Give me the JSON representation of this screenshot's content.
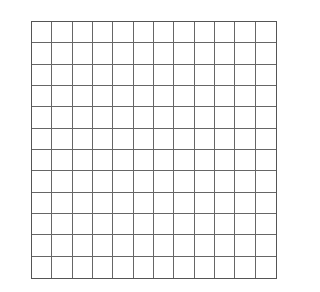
{
  "grid": {
    "rows": 12,
    "cols": 12,
    "line_color": "#666666",
    "border_color": "#555555",
    "background": "#ffffff"
  }
}
